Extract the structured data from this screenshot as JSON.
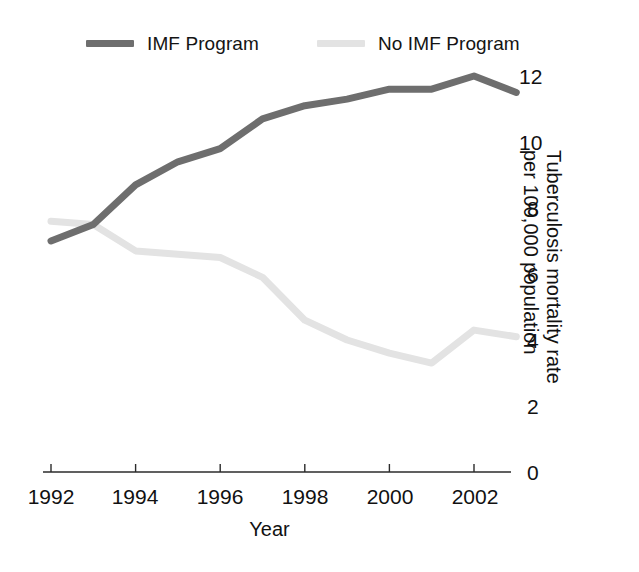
{
  "chart_data": {
    "type": "line",
    "title": "",
    "xlabel": "Year",
    "ylabel": "Tuberculosis mortality rate\nper 100,000 population",
    "x": [
      1992,
      1993,
      1994,
      1995,
      1996,
      1997,
      1998,
      1999,
      2000,
      2001,
      2002,
      2003
    ],
    "xlim": [
      1992,
      2003.3
    ],
    "ylim": [
      0,
      12.6
    ],
    "xticks": [
      "1992",
      "1994",
      "1996",
      "1998",
      "2000",
      "2002"
    ],
    "xtick_values": [
      1992,
      1994,
      1996,
      1998,
      2000,
      2002
    ],
    "yticks": [
      "0",
      "2",
      "4",
      "6",
      "8",
      "10",
      "12"
    ],
    "ytick_values": [
      0,
      2,
      4,
      6,
      8,
      10,
      12
    ],
    "y_axis_position": "right",
    "grid": false,
    "legend_position": "top",
    "series": [
      {
        "name": "IMF Program",
        "color": "#6e6e6e",
        "values": [
          7.0,
          7.5,
          8.7,
          9.4,
          9.8,
          10.7,
          11.1,
          11.3,
          11.6,
          11.6,
          12.0,
          11.5
        ]
      },
      {
        "name": "No IMF Program",
        "color": "#e3e3e3",
        "values": [
          7.6,
          7.5,
          6.7,
          6.6,
          6.5,
          5.9,
          4.6,
          4.0,
          3.6,
          3.3,
          4.3,
          4.1
        ]
      }
    ]
  },
  "legend": {
    "items": [
      {
        "label": "IMF Program",
        "color": "#6e6e6e"
      },
      {
        "label": "No IMF Program",
        "color": "#e3e3e3"
      }
    ]
  },
  "axes": {
    "x_title": "Year",
    "y_title": "Tuberculosis mortality rate\nper 100,000 population",
    "x_tick_labels": [
      "1992",
      "1994",
      "1996",
      "1998",
      "2000",
      "2002"
    ],
    "y_tick_labels": [
      "12",
      "10",
      "8",
      "6",
      "4",
      "2",
      "0"
    ]
  },
  "colors": {
    "axis": "#2b2b2b",
    "text": "#111111",
    "series_imf": "#6e6e6e",
    "series_no_imf": "#e3e3e3",
    "background": "#ffffff"
  }
}
